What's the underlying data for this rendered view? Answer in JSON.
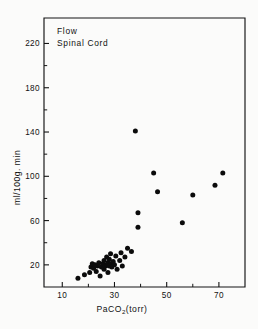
{
  "figure": {
    "panel_label_line1": "Flow",
    "panel_label_line2": "Spinal Cord"
  },
  "chart_data": {
    "type": "scatter",
    "title": "Flow Spinal Cord",
    "subtitle": "",
    "xlabel": "PaCO2(torr)",
    "xlabel_base": "PaCO",
    "xlabel_subscript": "2",
    "xlabel_units": "(torr)",
    "ylabel": "ml/100g. min",
    "xlim": [
      3,
      80
    ],
    "ylim": [
      0,
      243
    ],
    "xticks": [
      10,
      30,
      50,
      70
    ],
    "xticklabels": [
      "10",
      "30",
      "50",
      "70"
    ],
    "xminorticks": [
      20,
      40,
      60
    ],
    "yticks": [
      20,
      60,
      100,
      140,
      180,
      220
    ],
    "yticklabels": [
      "20",
      "60",
      "100",
      "140",
      "180",
      "220"
    ],
    "yminorticks": [
      40,
      80,
      120,
      160,
      200
    ],
    "grid": false,
    "legend": false,
    "marker": "filled-circle",
    "marker_color": "#0b0b0b",
    "points": [
      {
        "x": 16.0,
        "y": 8
      },
      {
        "x": 18.5,
        "y": 11
      },
      {
        "x": 20.5,
        "y": 13
      },
      {
        "x": 21.0,
        "y": 18
      },
      {
        "x": 21.5,
        "y": 21
      },
      {
        "x": 22.0,
        "y": 17
      },
      {
        "x": 22.5,
        "y": 20
      },
      {
        "x": 23.0,
        "y": 14
      },
      {
        "x": 23.5,
        "y": 19
      },
      {
        "x": 24.0,
        "y": 22
      },
      {
        "x": 24.5,
        "y": 10
      },
      {
        "x": 25.0,
        "y": 18
      },
      {
        "x": 25.5,
        "y": 21
      },
      {
        "x": 26.0,
        "y": 16
      },
      {
        "x": 26.0,
        "y": 24
      },
      {
        "x": 26.5,
        "y": 19
      },
      {
        "x": 27.0,
        "y": 20
      },
      {
        "x": 27.0,
        "y": 27
      },
      {
        "x": 27.5,
        "y": 22
      },
      {
        "x": 27.5,
        "y": 13
      },
      {
        "x": 28.0,
        "y": 19
      },
      {
        "x": 28.0,
        "y": 25
      },
      {
        "x": 28.5,
        "y": 21
      },
      {
        "x": 28.5,
        "y": 30
      },
      {
        "x": 29.0,
        "y": 18
      },
      {
        "x": 29.5,
        "y": 23
      },
      {
        "x": 30.0,
        "y": 20
      },
      {
        "x": 30.5,
        "y": 28
      },
      {
        "x": 31.0,
        "y": 16
      },
      {
        "x": 32.0,
        "y": 24
      },
      {
        "x": 32.5,
        "y": 31
      },
      {
        "x": 33.0,
        "y": 19
      },
      {
        "x": 34.0,
        "y": 27
      },
      {
        "x": 35.0,
        "y": 35
      },
      {
        "x": 36.5,
        "y": 32
      },
      {
        "x": 38.0,
        "y": 141
      },
      {
        "x": 39.0,
        "y": 67
      },
      {
        "x": 39.0,
        "y": 54
      },
      {
        "x": 45.0,
        "y": 103
      },
      {
        "x": 46.5,
        "y": 86
      },
      {
        "x": 56.0,
        "y": 58
      },
      {
        "x": 60.0,
        "y": 83
      },
      {
        "x": 68.5,
        "y": 92
      },
      {
        "x": 71.5,
        "y": 103
      }
    ]
  }
}
